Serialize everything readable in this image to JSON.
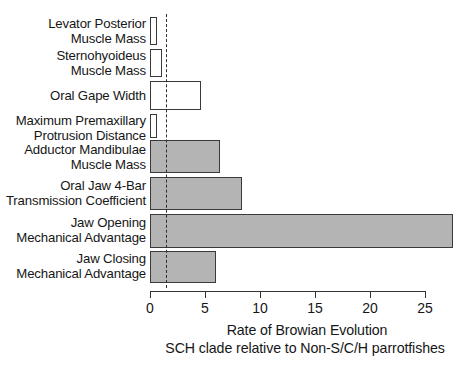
{
  "chart_data": {
    "type": "bar",
    "orientation": "horizontal",
    "title": "",
    "xlabel": "Rate of Browian Evolution SCH clade relative to Non-S/C/H parrotfishes",
    "ylabel": "",
    "xlim": [
      0,
      28
    ],
    "xticks": [
      0,
      5,
      10,
      15,
      20,
      25
    ],
    "xticklabels": [
      "0",
      "5",
      "10",
      "15",
      "20",
      "25"
    ],
    "grid": false,
    "legend": false,
    "reference_line": {
      "value": 1.45,
      "style": "dashed",
      "color": "#2e2e2e"
    },
    "categories": [
      "Levator Posterior Muscle Mass",
      "Sternohyoideus Muscle Mass",
      "Oral Gape Width",
      "Maximum Premaxillary Protrusion Distance",
      "Adductor Mandibulae Muscle Mass",
      "Oral Jaw 4-Bar Transmission Coefficient",
      "Jaw Opening Mechanical Advantage",
      "Jaw Closing Mechanical Advantage"
    ],
    "values": [
      0.6,
      1.1,
      4.6,
      0.65,
      6.4,
      8.4,
      27.5,
      6.0
    ],
    "bar_styles": [
      "open",
      "open",
      "open",
      "open",
      "filled",
      "filled",
      "filled",
      "filled"
    ],
    "colors": {
      "open_fill": "#ffffff",
      "filled_fill": "#b4b4b4",
      "bar_edge": "#3a3a3a"
    }
  },
  "axis_title": {
    "line1": "Rate of Browian Evolution",
    "line2": "SCH clade relative to Non-S/C/H parrotfishes"
  },
  "category_labels": [
    {
      "line1": "Levator Posterior",
      "line2": "Muscle Mass"
    },
    {
      "line1": "Sternohyoideus",
      "line2": "Muscle Mass"
    },
    {
      "line1": "Oral Gape Width",
      "line2": ""
    },
    {
      "line1": "Maximum Premaxillary",
      "line2": "Protrusion Distance"
    },
    {
      "line1": "Adductor Mandibulae",
      "line2": "Muscle Mass"
    },
    {
      "line1": "Oral Jaw 4-Bar",
      "line2": "Transmission Coefficient"
    },
    {
      "line1": "Jaw Opening",
      "line2": "Mechanical Advantage"
    },
    {
      "line1": "Jaw Closing",
      "line2": "Mechanical Advantage"
    }
  ],
  "tick_labels": [
    "0",
    "5",
    "10",
    "15",
    "20",
    "25"
  ]
}
